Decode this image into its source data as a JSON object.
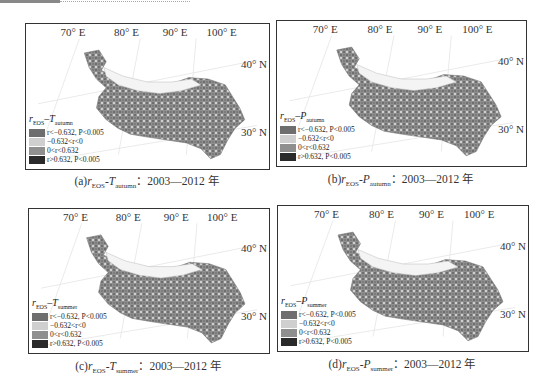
{
  "figure": {
    "lon_labels": [
      "70° E",
      "80° E",
      "90° E",
      "100° E"
    ],
    "lat_labels": [
      "40° N",
      "30° N"
    ],
    "legend_classes": [
      {
        "label": "r<−0.632, P<0.005",
        "color": "#6e6e6e"
      },
      {
        "label": "−0.632<r<0",
        "color": "#cfcfcf"
      },
      {
        "label": "0<r<0.632",
        "color": "#8f8f8f"
      },
      {
        "label": "r>0.632, P<0.005",
        "color": "#2a2a2a"
      }
    ],
    "panels": [
      {
        "id": "a",
        "legend_r": "r",
        "legend_sub_r": "EOS",
        "legend_var": "T",
        "legend_sub_var": "autumn",
        "caption_prefix": "(a)",
        "caption_r": "r",
        "caption_sub_r": "EOS",
        "caption_sep": "-",
        "caption_var": "T",
        "caption_sub_var": "autumn",
        "caption_suffix": "：2003—2012 年"
      },
      {
        "id": "b",
        "legend_r": "r",
        "legend_sub_r": "EOS",
        "legend_var": "P",
        "legend_sub_var": "autumn",
        "caption_prefix": "(b)",
        "caption_r": "r",
        "caption_sub_r": "EOS",
        "caption_sep": "-",
        "caption_var": "P",
        "caption_sub_var": "autumn",
        "caption_suffix": "：2003—2012 年"
      },
      {
        "id": "c",
        "legend_r": "r",
        "legend_sub_r": "EOS",
        "legend_var": "T",
        "legend_sub_var": "summer",
        "caption_prefix": "(c)",
        "caption_r": "r",
        "caption_sub_r": "EOS",
        "caption_sep": "-",
        "caption_var": "T",
        "caption_sub_var": "summer",
        "caption_suffix": "：2003—2012 年"
      },
      {
        "id": "d",
        "legend_r": "r",
        "legend_sub_r": "EOS",
        "legend_var": "P",
        "legend_sub_var": "summer",
        "caption_prefix": "(d)",
        "caption_r": "r",
        "caption_sub_r": "EOS",
        "caption_sep": "-",
        "caption_var": "P",
        "caption_sub_var": "summer",
        "caption_suffix": "：2003—2012 年"
      }
    ]
  }
}
